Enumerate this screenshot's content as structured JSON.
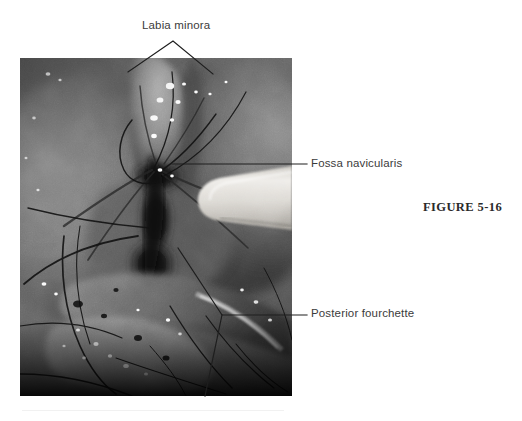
{
  "figure": {
    "number_label": "FIGURE 5-16",
    "caption_text": "",
    "media_type": "colposcopic photograph",
    "media_description": "Grayscale close-up clinical photograph of the posterior vulvar vestibule with a cotton-tipped applicator retracting tissue at the right",
    "colors": {
      "page_background": "#ffffff",
      "label_text": "#3b3b3b",
      "figure_number_text": "#2a2a2a",
      "leader_line": "#1e1e1e",
      "photo_midtone": "#6e6e6e",
      "photo_shadow": "#141414",
      "photo_highlight": "#f2f2f2",
      "swab_highlight": "#e8e6e2"
    }
  },
  "callouts": [
    {
      "id": "labia-minora",
      "label": "Labia minora",
      "leader_style": "branched-v",
      "label_x": 142,
      "label_y": 19
    },
    {
      "id": "fossa-navicularis",
      "label": "Fossa navicularis",
      "leader_style": "horizontal",
      "label_x": 311,
      "label_y": 157
    },
    {
      "id": "posterior-fourchette",
      "label": "Posterior fourchette",
      "leader_style": "branched-y",
      "label_x": 311,
      "label_y": 307
    }
  ],
  "photo": {
    "x": 20,
    "y": 58,
    "width": 272,
    "height": 338
  }
}
